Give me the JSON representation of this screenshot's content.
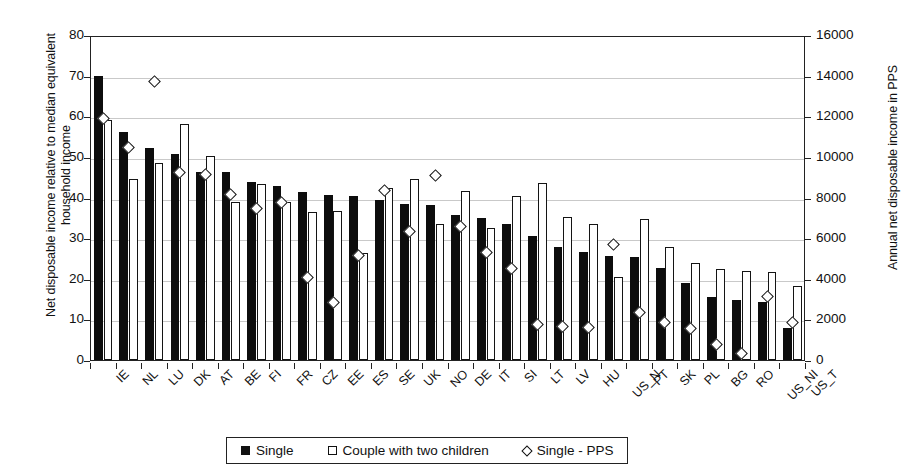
{
  "chart_data": {
    "type": "bar",
    "title": "",
    "xlabel": "",
    "ylabel": "Net disposable income relative to median equivalent household income",
    "ylabel_secondary": "Annual net disposable income in PPS",
    "ylim": [
      0,
      80
    ],
    "yticks": [
      0,
      10,
      20,
      30,
      40,
      50,
      60,
      70,
      80
    ],
    "ylim_secondary": [
      0,
      16000
    ],
    "yticks_secondary": [
      0,
      2000,
      4000,
      6000,
      8000,
      10000,
      12000,
      14000,
      16000
    ],
    "grid": true,
    "legend_position": "bottom-center",
    "categories": [
      "IE",
      "NL",
      "LU",
      "DK",
      "AT",
      "BE",
      "FI",
      "FR",
      "CZ",
      "EE",
      "ES",
      "SE",
      "UK",
      "NO",
      "DE",
      "IT",
      "SI",
      "LT",
      "LV",
      "HU",
      "US_N",
      "PT",
      "SK",
      "PL",
      "BG",
      "RO",
      "US_NI",
      "US_T"
    ],
    "series": [
      {
        "name": "Single",
        "type": "bar",
        "style": "filled",
        "axis": "left",
        "values": [
          70.0,
          56.2,
          52.2,
          50.8,
          46.2,
          46.2,
          43.8,
          42.9,
          41.3,
          40.5,
          40.3,
          39.5,
          38.5,
          38.2,
          35.8,
          35.0,
          33.4,
          30.6,
          27.9,
          26.7,
          25.5,
          25.3,
          22.7,
          18.9,
          15.4,
          14.8,
          14.2,
          8.0
        ]
      },
      {
        "name": "Couple with two children",
        "type": "bar",
        "style": "open",
        "axis": "left",
        "values": [
          59.0,
          44.5,
          48.5,
          58.2,
          50.3,
          38.8,
          43.3,
          38.8,
          36.5,
          36.7,
          26.4,
          42.3,
          44.5,
          33.5,
          41.7,
          32.6,
          40.4,
          43.5,
          35.3,
          33.6,
          20.5,
          34.7,
          27.7,
          24.0,
          22.3,
          21.8,
          21.6,
          18.2
        ]
      },
      {
        "name": "Single - PPS",
        "type": "scatter",
        "style": "diamond",
        "axis": "right",
        "values_left_scale": [
          60.0,
          52.8,
          69.0,
          46.6,
          46.2,
          41.3,
          37.9,
          39.2,
          20.8,
          14.6,
          26.2,
          42.3,
          32.2,
          46.0,
          33.3,
          26.9,
          23.0,
          9.3,
          8.8,
          8.6,
          29.0,
          12.1,
          9.7,
          8.3,
          4.2,
          2.2,
          16.2,
          9.7
        ],
        "values_pps": [
          12000,
          10560,
          13800,
          9320,
          9240,
          8260,
          7580,
          7840,
          4160,
          2920,
          5240,
          8460,
          6440,
          9200,
          6660,
          5380,
          4600,
          1860,
          1760,
          1720,
          5800,
          2420,
          1940,
          1660,
          840,
          440,
          3240,
          1940
        ]
      }
    ]
  },
  "legend": {
    "items": [
      {
        "marker": "filled-square-icon",
        "label": "Single"
      },
      {
        "marker": "open-square-icon",
        "label": "Couple with two children"
      },
      {
        "marker": "diamond-icon",
        "label": "Single - PPS"
      }
    ]
  },
  "colors": {
    "single": "#0d0d0d",
    "couple": "#ffffff",
    "outline": "#141414",
    "grid": "#c9c9c9",
    "axis": "#222222",
    "background": "#ffffff"
  }
}
